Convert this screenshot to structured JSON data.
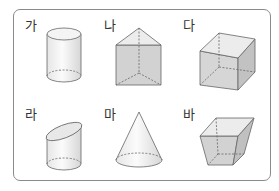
{
  "figure": {
    "type": "solid-figures-comparison",
    "items": [
      {
        "label": "가",
        "shape": "cylinder"
      },
      {
        "label": "나",
        "shape": "triangular-prism"
      },
      {
        "label": "다",
        "shape": "cube"
      },
      {
        "label": "라",
        "shape": "obliquely-cut-cylinder"
      },
      {
        "label": "마",
        "shape": "cone"
      },
      {
        "label": "바",
        "shape": "truncated-square-pyramid"
      }
    ],
    "colors": {
      "stroke": "#666666",
      "face_light": "#eeeeee",
      "face_mid": "#d9d9d9",
      "face_dark": "#c4c4c4",
      "frame": "#8a8a8a"
    }
  }
}
